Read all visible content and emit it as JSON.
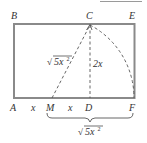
{
  "diagram": {
    "colors": {
      "stroke": "#8a8a8a",
      "text": "#333333",
      "background": "#ffffff"
    },
    "points": {
      "A": {
        "label": "A"
      },
      "B": {
        "label": "B"
      },
      "C": {
        "label": "C"
      },
      "D": {
        "label": "D"
      },
      "E": {
        "label": "E"
      },
      "F": {
        "label": "F"
      },
      "M": {
        "label": "M"
      }
    },
    "segment_labels": {
      "AM": "x",
      "MD": "x",
      "CD": "2x",
      "MC": "5x",
      "MF": "5x"
    },
    "superscript": "2",
    "radical": "√"
  }
}
